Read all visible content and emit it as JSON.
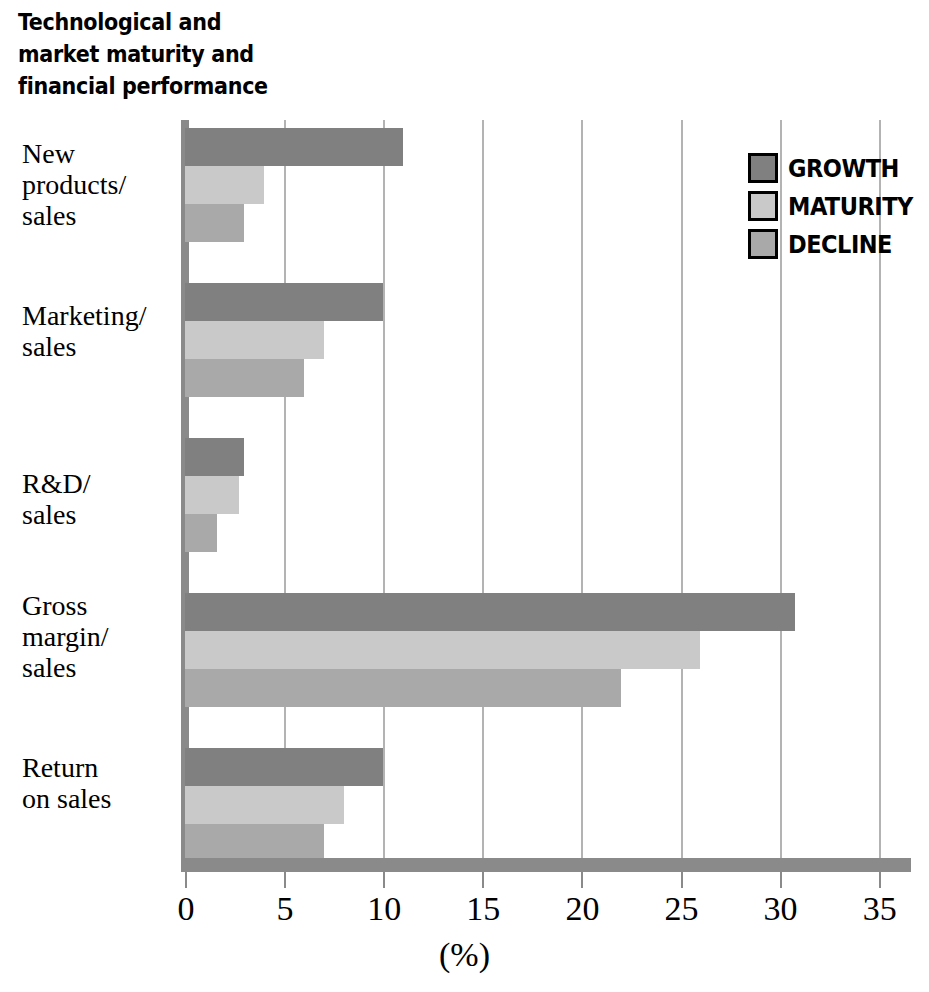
{
  "title": "Technological and\nmarket maturity and\nfinancial performance",
  "legend": {
    "position": "top-right",
    "items": [
      {
        "label": "GROWTH",
        "color": "#808080",
        "icon": "legend-swatch"
      },
      {
        "label": "MATURITY",
        "color": "#c9c9c9",
        "icon": "legend-swatch"
      },
      {
        "label": "DECLINE",
        "color": "#a9a9a9",
        "icon": "legend-swatch"
      }
    ]
  },
  "axis": {
    "x_unit_label": "(%)",
    "ticks": [
      "0",
      "5",
      "10",
      "15",
      "20",
      "25",
      "30",
      "35"
    ]
  },
  "categories_display": [
    "New\nproducts/\nsales",
    "Marketing/\nsales",
    "R&D/\nsales",
    "Gross\nmargin/\nsales",
    "Return\non sales"
  ],
  "chart_data": {
    "type": "bar",
    "orientation": "horizontal",
    "title": "Technological and market maturity and financial performance",
    "xlabel": "(%)",
    "ylabel": "",
    "xlim": [
      0,
      36.8
    ],
    "xticks": [
      0,
      5,
      10,
      15,
      20,
      25,
      30,
      35
    ],
    "grid": "vertical",
    "legend_position": "top-right",
    "categories": [
      "New products/sales",
      "Marketing/sales",
      "R&D/sales",
      "Gross margin/sales",
      "Return on sales"
    ],
    "series": [
      {
        "name": "GROWTH",
        "color": "#808080",
        "values": [
          11,
          10,
          3,
          30.8,
          10
        ]
      },
      {
        "name": "MATURITY",
        "color": "#c9c9c9",
        "values": [
          4,
          7,
          2.7,
          26,
          8
        ]
      },
      {
        "name": "DECLINE",
        "color": "#a9a9a9",
        "values": [
          3,
          6,
          1.6,
          22,
          7
        ]
      }
    ]
  }
}
